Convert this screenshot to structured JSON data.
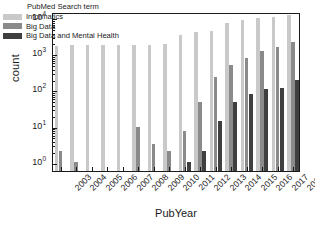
{
  "chart_data": {
    "type": "bar",
    "title": "",
    "xlabel": "PubYear",
    "ylabel": "count",
    "yscale": "log",
    "ylim": [
      0.55,
      14000
    ],
    "grid": false,
    "legend_position": "upper-left-inside",
    "legend_title": "PubMed Search term",
    "categories": [
      "2003",
      "2004",
      "2005",
      "2006",
      "2007",
      "2008",
      "2009",
      "2010",
      "2011",
      "2012",
      "2013",
      "2014",
      "2015",
      "2016",
      "2017",
      "2018"
    ],
    "ytick_labels": [
      "10^0",
      "10^1",
      "10^2",
      "10^3",
      "10^4"
    ],
    "ytick_values": [
      1,
      10,
      100,
      1000,
      10000
    ],
    "series": [
      {
        "name": "Informatics",
        "color": "#c9c9c9",
        "values": [
          1650,
          1700,
          1750,
          1720,
          1700,
          1750,
          1750,
          1780,
          3300,
          3800,
          4100,
          6800,
          8500,
          9700,
          10500,
          11500
        ]
      },
      {
        "name": "Big Data",
        "color": "#8a8a8a",
        "values": [
          2,
          1,
          0,
          0,
          0,
          9,
          3,
          2,
          7,
          45,
          220,
          490,
          750,
          1200,
          1500,
          2100
        ]
      },
      {
        "name": "Big Data and Mental Health",
        "color": "#3f3f3f",
        "values": [
          0,
          0,
          0,
          0,
          0,
          0,
          0,
          0,
          1,
          2,
          13,
          44,
          74,
          105,
          112,
          180
        ]
      }
    ]
  }
}
